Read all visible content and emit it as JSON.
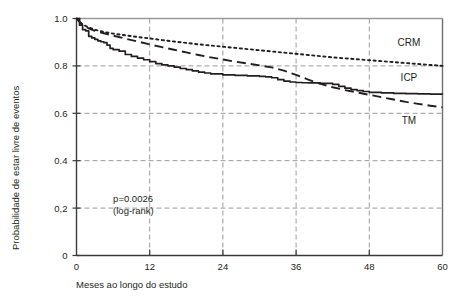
{
  "chart_data": {
    "type": "line",
    "title": "",
    "xlabel": "Meses ao longo do estudo",
    "ylabel": "Probabilidade de estar livre de eventos",
    "xlim": [
      0,
      60
    ],
    "ylim": [
      0,
      1.0
    ],
    "xticks": [
      0,
      12,
      24,
      36,
      48,
      60
    ],
    "xtick_labels": [
      "0",
      "12",
      "24",
      "36",
      "48",
      "60"
    ],
    "yticks": [
      0,
      0.2,
      0.4,
      0.6,
      0.8,
      1.0
    ],
    "ytick_labels": [
      "0",
      "0,2",
      "0.4",
      "0.6",
      "0.8",
      "1.0"
    ],
    "grid": true,
    "grid_style": "dashed",
    "grid_color": "#9a9a9a",
    "legend_position": "inline-right",
    "annotations": [
      {
        "name": "p-value",
        "line1": "p=0.0026",
        "line2": "(log-rank)",
        "x": 6,
        "y": 0.225
      }
    ],
    "series": [
      {
        "name": "CRM",
        "style": "dotted",
        "color": "#231f20",
        "label_x": 54.5,
        "label_y": 0.885,
        "x": [
          0,
          1,
          2,
          3,
          4,
          5,
          6,
          8,
          10,
          12,
          14,
          16,
          18,
          20,
          22,
          24,
          26,
          28,
          30,
          32,
          34,
          36,
          38,
          40,
          42,
          44,
          46,
          48,
          50,
          52,
          54,
          56,
          58,
          60
        ],
        "y": [
          1.0,
          0.975,
          0.962,
          0.953,
          0.946,
          0.941,
          0.936,
          0.929,
          0.922,
          0.916,
          0.909,
          0.903,
          0.897,
          0.891,
          0.886,
          0.881,
          0.876,
          0.871,
          0.866,
          0.861,
          0.856,
          0.851,
          0.846,
          0.841,
          0.836,
          0.832,
          0.828,
          0.824,
          0.82,
          0.816,
          0.812,
          0.808,
          0.804,
          0.8
        ]
      },
      {
        "name": "ICP",
        "style": "solid",
        "color": "#231f20",
        "label_x": 54.5,
        "label_y": 0.735,
        "x": [
          0,
          0.5,
          1,
          1.5,
          2,
          2.5,
          3,
          3.5,
          4,
          4.5,
          5,
          5.5,
          6,
          7,
          8,
          9,
          10,
          11,
          12,
          13,
          14,
          15,
          16,
          17,
          18,
          19,
          20,
          21,
          22,
          24,
          26,
          28,
          30,
          31,
          32,
          33,
          34,
          35,
          36,
          37,
          38,
          40,
          42,
          43,
          44,
          45,
          46,
          47,
          48,
          50,
          52,
          54,
          56,
          58,
          60
        ],
        "y": [
          1.0,
          0.972,
          0.953,
          0.948,
          0.925,
          0.918,
          0.912,
          0.906,
          0.902,
          0.898,
          0.888,
          0.874,
          0.869,
          0.862,
          0.848,
          0.84,
          0.833,
          0.826,
          0.818,
          0.81,
          0.804,
          0.8,
          0.795,
          0.789,
          0.784,
          0.779,
          0.774,
          0.77,
          0.766,
          0.762,
          0.76,
          0.758,
          0.756,
          0.754,
          0.75,
          0.742,
          0.736,
          0.732,
          0.73,
          0.729,
          0.728,
          0.726,
          0.722,
          0.714,
          0.706,
          0.7,
          0.696,
          0.692,
          0.688,
          0.686,
          0.684,
          0.683,
          0.682,
          0.681,
          0.68
        ]
      },
      {
        "name": "TM",
        "style": "dashed",
        "color": "#231f20",
        "label_x": 54.5,
        "label_y": 0.555,
        "x": [
          0,
          1,
          2,
          3,
          4,
          6,
          8,
          10,
          12,
          14,
          16,
          18,
          20,
          22,
          24,
          26,
          28,
          30,
          32,
          34,
          36,
          38,
          40,
          42,
          44,
          46,
          48,
          50,
          52,
          54,
          56,
          58,
          60
        ],
        "y": [
          1.0,
          0.972,
          0.958,
          0.948,
          0.941,
          0.928,
          0.915,
          0.903,
          0.891,
          0.879,
          0.868,
          0.857,
          0.846,
          0.836,
          0.827,
          0.818,
          0.81,
          0.802,
          0.794,
          0.78,
          0.762,
          0.742,
          0.724,
          0.71,
          0.698,
          0.688,
          0.678,
          0.668,
          0.658,
          0.648,
          0.64,
          0.632,
          0.625
        ]
      }
    ]
  },
  "axes": {
    "x_axis_name": "months-axis",
    "y_axis_name": "probability-axis"
  }
}
